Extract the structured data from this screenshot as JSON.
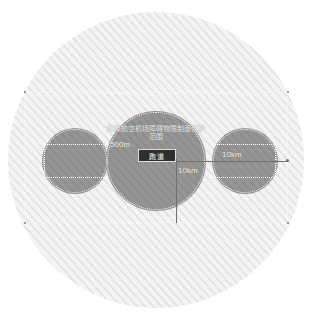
{
  "diagram": {
    "zone_title": "民用航空机场障碍物限制面保护范围",
    "runway_label": "跑道",
    "dimensions": {
      "inner_radius": "500m",
      "outer_radius": "10km",
      "vertical_extent": "10km"
    },
    "colors": {
      "zone_fill": "#f0f0f0",
      "zone_stripe": "#e4e4e4",
      "obstacle_fill": "#8d8d8d",
      "dash_line": "#ffffff",
      "leader_line": "#6f6f6f",
      "runway_chip": "#2f2f2f",
      "runway_text": "#f4f4f4"
    }
  }
}
